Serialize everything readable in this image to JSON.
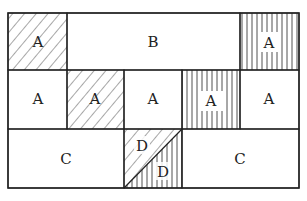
{
  "diagram": {
    "rows": [
      {
        "cells": [
          {
            "label": "A",
            "fill": "diagonal-hatch"
          },
          {
            "label": "B",
            "fill": "none"
          },
          {
            "label": "A",
            "fill": "vertical-hatch"
          }
        ]
      },
      {
        "cells": [
          {
            "label": "A",
            "fill": "none"
          },
          {
            "label": "A",
            "fill": "diagonal-hatch"
          },
          {
            "label": "A",
            "fill": "none"
          },
          {
            "label": "A",
            "fill": "vertical-hatch"
          },
          {
            "label": "A",
            "fill": "none"
          }
        ]
      },
      {
        "cells": [
          {
            "label": "C",
            "fill": "none"
          },
          {
            "label_upper": "D",
            "label_lower": "D",
            "fill": "split-diagonal: upper-left diagonal-hatch, lower-right vertical-hatch"
          },
          {
            "label": "C",
            "fill": "none"
          }
        ]
      }
    ],
    "colors": {
      "stroke": "#222222",
      "background": "#ffffff"
    }
  }
}
